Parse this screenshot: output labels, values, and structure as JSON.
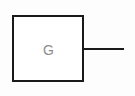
{
  "diagram": {
    "type": "schematic-symbol",
    "canvas": {
      "width": 135,
      "height": 96,
      "background_color": "#fdfdfd"
    },
    "colors": {
      "stroke": "#1a1a1a",
      "label_text": "#8c8c8c",
      "body_fill": "#ffffff"
    },
    "body": {
      "shape": "rectangle",
      "x": 12,
      "y": 15,
      "width": 72,
      "height": 67,
      "stroke_width": 2,
      "fill": "#ffffff"
    },
    "label": {
      "text": "G",
      "center_x": 48,
      "center_y": 50,
      "font_size": 14,
      "color": "#8c8c8c"
    },
    "lead": {
      "orientation": "horizontal",
      "x1": 84,
      "y1": 48,
      "x2": 124,
      "y2": 48,
      "stroke_width": 2
    }
  }
}
